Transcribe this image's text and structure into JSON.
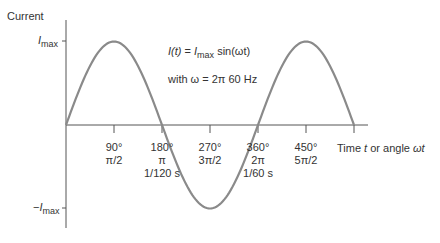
{
  "y_axis": {
    "title": "Current",
    "top_label_main": "I",
    "top_label_sub": "max",
    "bottom_label_prefix": "−",
    "bottom_label_main": "I",
    "bottom_label_sub": "max"
  },
  "x_axis": {
    "title_part1": "Time ",
    "title_t": "t",
    "title_part2": " or angle ",
    "title_omega_t": "ωt"
  },
  "equation": {
    "lhs": "I(t)",
    "eq": " = ",
    "imax_main": "I",
    "imax_sub": "max",
    "rhs": " sin(ωt)",
    "with_line": "with ω = 2π 60 Hz"
  },
  "ticks": [
    {
      "deg": "90°",
      "rad": "π/2",
      "time": ""
    },
    {
      "deg": "180°",
      "rad": "π",
      "time": "1/120 s"
    },
    {
      "deg": "270°",
      "rad": "3π/2",
      "time": ""
    },
    {
      "deg": "360°",
      "rad": "2π",
      "time": "1/60 s"
    },
    {
      "deg": "450°",
      "rad": "5π/2",
      "time": ""
    }
  ],
  "colors": {
    "curve": "#8a8a8a",
    "axis": "#555555",
    "text": "#333333"
  }
}
